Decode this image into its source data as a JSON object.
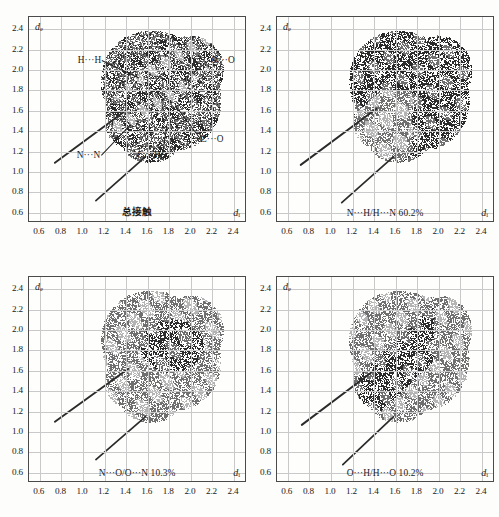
{
  "figure": {
    "type": "fingerprint-plot-grid",
    "rows": 2,
    "columns": 2,
    "axis_titles": {
      "y": "d",
      "y_sub": "e",
      "x": "d",
      "x_sub": "i"
    },
    "tick_values": [
      "0.6",
      "0.8",
      "1.0",
      "1.2",
      "1.4",
      "1.6",
      "1.8",
      "2.0",
      "2.2",
      "2.4"
    ],
    "colors": {
      "frame": "#4a4a4a",
      "gridline": "#c9c9c9",
      "background": "#fefefd",
      "scatter_dark": "#2b2b2b",
      "scatter_mid": "#6f6f6f",
      "scatter_light": "#b4b4b4",
      "text": "#1a1a1a"
    }
  },
  "chart_data": {
    "type": "scatter",
    "title": "",
    "xlabel": "d_i",
    "ylabel": "d_e",
    "xlim": [
      0.5,
      2.5
    ],
    "ylim": [
      0.5,
      2.5
    ],
    "xticks": [
      0.6,
      0.8,
      1.0,
      1.2,
      1.4,
      1.6,
      1.8,
      2.0,
      2.2,
      2.4
    ],
    "yticks": [
      0.6,
      0.8,
      1.0,
      1.2,
      1.4,
      1.6,
      1.8,
      2.0,
      2.2,
      2.4
    ],
    "grid": true,
    "legend": "none",
    "panels": [
      {
        "id": "panel-total-contacts",
        "caption": "总接触",
        "caption_is_cjk": true,
        "percent": null,
        "contact": "total",
        "annotations": [
          {
            "label": "H···H",
            "x": 1.18,
            "y": 2.1,
            "point_x": 1.52,
            "point_y": 1.93
          },
          {
            "label": "O···O",
            "x": 2.18,
            "y": 2.1,
            "point_x": 2.04,
            "point_y": 1.98
          },
          {
            "label": "N···N",
            "x": 1.17,
            "y": 1.17,
            "point_x": 1.44,
            "point_y": 1.47
          },
          {
            "label": "C···H",
            "x": 1.73,
            "y": 1.17,
            "point_x": 1.77,
            "point_y": 1.46
          },
          {
            "label": "C···O",
            "x": 2.08,
            "y": 1.32,
            "point_x": 1.88,
            "point_y": 1.6
          }
        ],
        "spike_upper": {
          "x0": 0.74,
          "y0": 1.09,
          "x1": 1.42,
          "y1": 1.62
        },
        "spike_lower": {
          "x0": 1.12,
          "y0": 0.72,
          "x1": 1.58,
          "y1": 1.15
        }
      },
      {
        "id": "panel-n-h",
        "caption": "N···H/H···N 60.2%",
        "caption_is_cjk": false,
        "percent": 60.2,
        "contact": "N···H/H···N",
        "annotations": [],
        "spike_upper": {
          "x0": 0.72,
          "y0": 1.07,
          "x1": 1.42,
          "y1": 1.62
        },
        "spike_lower": {
          "x0": 1.1,
          "y0": 0.7,
          "x1": 1.58,
          "y1": 1.15
        }
      },
      {
        "id": "panel-n-o",
        "caption": "N···O/O···N 10.3%",
        "caption_is_cjk": false,
        "percent": 10.3,
        "contact": "N···O/O···N",
        "annotations": [],
        "spike_upper": {
          "x0": 0.74,
          "y0": 1.1,
          "x1": 1.42,
          "y1": 1.62
        },
        "spike_lower": {
          "x0": 1.12,
          "y0": 0.73,
          "x1": 1.58,
          "y1": 1.15
        }
      },
      {
        "id": "panel-o-h",
        "caption": "O···H/H···O 10.2%",
        "caption_is_cjk": false,
        "percent": 10.2,
        "contact": "O···H/H···O",
        "annotations": [],
        "spike_upper": {
          "x0": 0.73,
          "y0": 1.07,
          "x1": 1.42,
          "y1": 1.62
        },
        "spike_lower": {
          "x0": 1.11,
          "y0": 0.68,
          "x1": 1.58,
          "y1": 1.15
        }
      }
    ]
  }
}
